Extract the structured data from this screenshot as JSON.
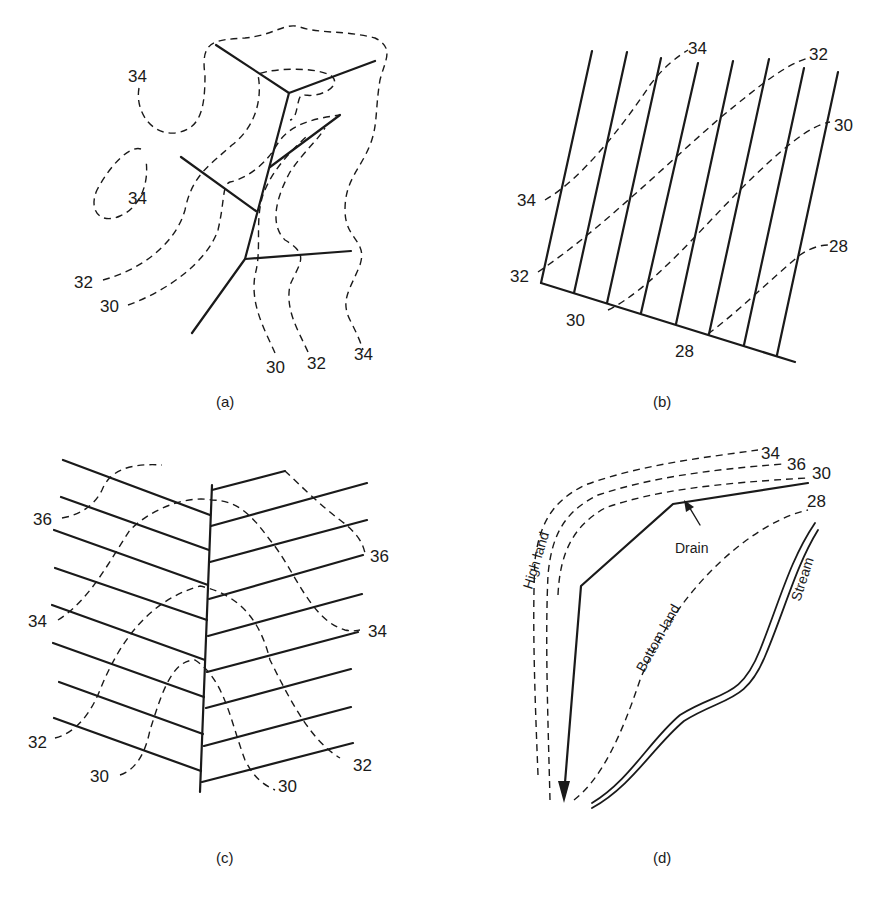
{
  "figure": {
    "panels": [
      {
        "id": "a",
        "caption": "(a)",
        "description": "Natural (random) drainage system following depressions",
        "contour_labels": [
          "34",
          "34",
          "32",
          "30",
          "30",
          "32",
          "34"
        ]
      },
      {
        "id": "b",
        "caption": "(b)",
        "description": "Parallel (gridiron) drainage system with main drain",
        "contour_labels": [
          "34",
          "32",
          "30",
          "28",
          "34",
          "32",
          "30",
          "28"
        ]
      },
      {
        "id": "c",
        "caption": "(c)",
        "description": "Herringbone drainage system",
        "contour_labels": [
          "36",
          "34",
          "32",
          "30",
          "36",
          "34",
          "32",
          "30"
        ]
      },
      {
        "id": "d",
        "caption": "(d)",
        "description": "Interception drain between high land and bottom land",
        "contour_labels": [
          "34",
          "36",
          "30",
          "28"
        ],
        "annotations": {
          "drain": "Drain",
          "high_land": "High land",
          "bottom_land": "Bottom land",
          "stream": "Stream"
        }
      }
    ]
  }
}
